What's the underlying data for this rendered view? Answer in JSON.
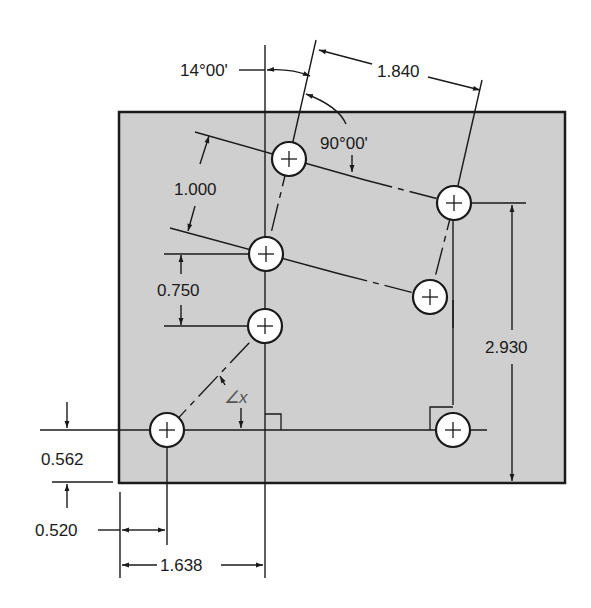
{
  "figure": {
    "type": "engineering-drawing",
    "plate": {
      "x": 119,
      "y": 112,
      "width": 446,
      "height": 371,
      "fill": "#cfcfcf"
    },
    "holes": [
      {
        "id": "hole-bottom-left",
        "cx": 167,
        "cy": 430
      },
      {
        "id": "hole-bottom-right",
        "cx": 453,
        "cy": 430
      },
      {
        "id": "hole-left-lower",
        "cx": 265,
        "cy": 326
      },
      {
        "id": "hole-left-middle",
        "cx": 266,
        "cy": 254
      },
      {
        "id": "hole-left-top",
        "cx": 289,
        "cy": 159
      },
      {
        "id": "hole-right-top",
        "cx": 454,
        "cy": 203
      },
      {
        "id": "hole-right-middle",
        "cx": 430,
        "cy": 297
      }
    ]
  },
  "dimensions": {
    "angle_tilt": "14°00'",
    "angle_right": "90°00'",
    "dist_top": "1.840",
    "dist_rotated": "1.000",
    "dist_vertical_small": "0.750",
    "dist_vertical_large": "2.930",
    "dist_bottom_edge": "0.562",
    "dist_left_edge": "0.520",
    "dist_baseline": "1.638",
    "angle_unknown": "∠x"
  }
}
